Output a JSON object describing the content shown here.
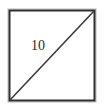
{
  "figure": {
    "canvas": {
      "width": 104,
      "height": 111,
      "background_color": "#ffffff"
    },
    "square": {
      "shape_name": "square",
      "left": 9,
      "top": 10,
      "width": 86,
      "height": 91,
      "fill_color": "#ffffff",
      "stroke_color": "#2f2f2f",
      "stroke_width": 2,
      "outer_edge_color": "#b9b9b9",
      "outer_edge_width": 1
    },
    "diagonal": {
      "shape_name": "diagonal-line",
      "from_corner": "bottom-left",
      "to_corner": "top-right",
      "x1": 10,
      "y1": 100,
      "x2": 94,
      "y2": 11,
      "stroke_color": "#3a3a3a",
      "stroke_width": 1.6,
      "label": "10"
    },
    "labels": [
      {
        "name": "diagonal-length-label",
        "text": "10",
        "left": 31,
        "top": 39,
        "font_size": 14,
        "color": "#2b2b2b"
      }
    ]
  }
}
